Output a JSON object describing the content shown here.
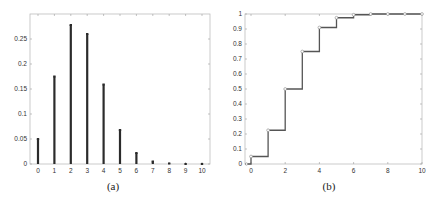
{
  "chart_data": [
    {
      "type": "bar",
      "subtype": "stem",
      "caption": "(a)",
      "title": "",
      "xlabel": "",
      "ylabel": "",
      "categories": [
        0,
        1,
        2,
        3,
        4,
        5,
        6,
        7,
        8,
        9,
        10
      ],
      "values": [
        0.05,
        0.175,
        0.278,
        0.26,
        0.159,
        0.068,
        0.022,
        0.005,
        0.001,
        0.0,
        0.0
      ],
      "xlim": [
        -0.5,
        10.5
      ],
      "ylim": [
        0,
        0.3
      ],
      "xticks": [
        "0",
        "1",
        "2",
        "3",
        "4",
        "5",
        "6",
        "7",
        "8",
        "9",
        "10"
      ],
      "yticks": [
        "0",
        "0.05",
        "0.1",
        "0.15",
        "0.2",
        "0.25"
      ],
      "grid": false,
      "legend": null,
      "bar_color": "#2b2b2b"
    },
    {
      "type": "line",
      "subtype": "step",
      "caption": "(b)",
      "title": "",
      "xlabel": "",
      "ylabel": "",
      "x": [
        0,
        1,
        2,
        3,
        4,
        5,
        6,
        7,
        8,
        9,
        10
      ],
      "values": [
        0.05,
        0.225,
        0.5,
        0.75,
        0.91,
        0.975,
        0.995,
        1.0,
        1.0,
        1.0,
        1.0
      ],
      "xlim": [
        -0.35,
        10
      ],
      "ylim": [
        0,
        1
      ],
      "xticks": [
        "0",
        "2",
        "4",
        "6",
        "8",
        "10"
      ],
      "yticks": [
        "0",
        "0.1",
        "0.2",
        "0.3",
        "0.4",
        "0.5",
        "0.6",
        "0.7",
        "0.8",
        "0.9",
        "1"
      ],
      "grid": false,
      "legend": null,
      "line_color": "#555555",
      "marker": "open-circle"
    }
  ]
}
